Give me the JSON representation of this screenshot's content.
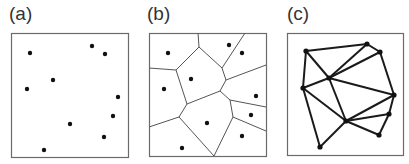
{
  "figure": {
    "panels": [
      {
        "label": "(a)",
        "kind": "points",
        "box": [
          11,
          33,
          128,
          157
        ],
        "points": [
          [
            30,
            53
          ],
          [
            92,
            46
          ],
          [
            105,
            54
          ],
          [
            53,
            80
          ],
          [
            27,
            89
          ],
          [
            118,
            97
          ],
          [
            113,
            116
          ],
          [
            70,
            124
          ],
          [
            104,
            137
          ],
          [
            44,
            150
          ]
        ]
      },
      {
        "label": "(b)",
        "kind": "voronoi",
        "box": [
          149,
          33,
          266,
          156
        ],
        "points": [
          [
            168,
            53
          ],
          [
            229,
            45
          ],
          [
            242,
            53
          ],
          [
            191,
            79
          ],
          [
            164,
            89
          ],
          [
            256,
            96
          ],
          [
            251,
            115
          ],
          [
            207,
            123
          ],
          [
            242,
            136
          ],
          [
            182,
            148
          ]
        ],
        "edges": [
          [
            [
              149,
              68
            ],
            [
              176,
              70
            ]
          ],
          [
            [
              176,
              70
            ],
            [
              199,
              47
            ]
          ],
          [
            [
              199,
              47
            ],
            [
              198,
              33
            ]
          ],
          [
            [
              199,
              47
            ],
            [
              222,
              68
            ]
          ],
          [
            [
              222,
              68
            ],
            [
              245,
              33
            ]
          ],
          [
            [
              222,
              68
            ],
            [
              226,
              80
            ]
          ],
          [
            [
              226,
              80
            ],
            [
              266,
              65
            ]
          ],
          [
            [
              226,
              80
            ],
            [
              220,
              91
            ]
          ],
          [
            [
              176,
              70
            ],
            [
              187,
              104
            ]
          ],
          [
            [
              187,
              104
            ],
            [
              220,
              91
            ]
          ],
          [
            [
              220,
              91
            ],
            [
              230,
              100
            ]
          ],
          [
            [
              230,
              100
            ],
            [
              266,
              107
            ]
          ],
          [
            [
              230,
              100
            ],
            [
              233,
              117
            ]
          ],
          [
            [
              233,
              117
            ],
            [
              266,
              131
            ]
          ],
          [
            [
              233,
              117
            ],
            [
              214,
              156
            ]
          ],
          [
            [
              187,
              104
            ],
            [
              179,
              117
            ]
          ],
          [
            [
              179,
              117
            ],
            [
              149,
              127
            ]
          ],
          [
            [
              179,
              117
            ],
            [
              214,
              156
            ]
          ]
        ]
      },
      {
        "label": "(c)",
        "kind": "delaunay",
        "box": [
          287,
          33,
          403,
          155
        ],
        "points": [
          [
            306,
            51
          ],
          [
            367,
            44
          ],
          [
            380,
            52
          ],
          [
            329,
            78
          ],
          [
            303,
            88
          ],
          [
            394,
            95
          ],
          [
            389,
            114
          ],
          [
            346,
            121
          ],
          [
            379,
            135
          ],
          [
            320,
            147
          ]
        ],
        "edges": [
          [
            0,
            1
          ],
          [
            1,
            2
          ],
          [
            0,
            3
          ],
          [
            0,
            4
          ],
          [
            1,
            3
          ],
          [
            2,
            3
          ],
          [
            2,
            5
          ],
          [
            3,
            4
          ],
          [
            3,
            5
          ],
          [
            3,
            7
          ],
          [
            4,
            7
          ],
          [
            4,
            9
          ],
          [
            9,
            7
          ],
          [
            7,
            5
          ],
          [
            7,
            6
          ],
          [
            7,
            8
          ],
          [
            5,
            6
          ],
          [
            6,
            8
          ]
        ]
      }
    ],
    "colors": {
      "frame": "#6b6b6b",
      "point": "#111111",
      "voronoi_edge": "#555555",
      "delaunay_edge": "#1a1a1a",
      "label": "#333333"
    }
  }
}
